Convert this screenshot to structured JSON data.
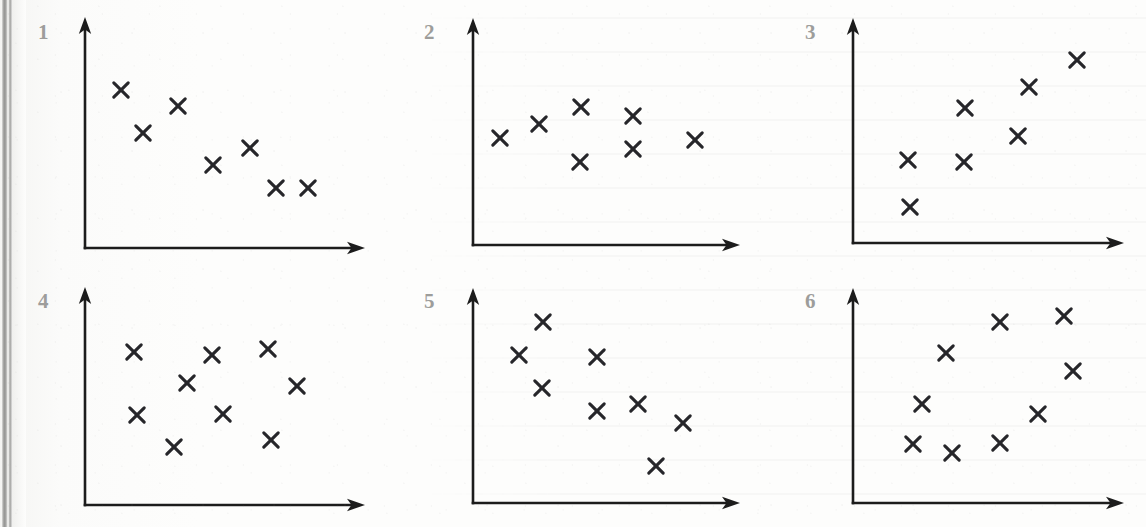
{
  "page": {
    "width": 1146,
    "height": 527,
    "background_color": "#fdfdfc",
    "ink_color": "#1c1c1c",
    "marker_color": "#26262a",
    "label_color": "#9d9d9b",
    "marker_glyph": "x"
  },
  "chart_data": [
    {
      "id": 1,
      "type": "scatter",
      "title": "1",
      "xlabel": "",
      "ylabel": "",
      "grid": false,
      "legend": "none",
      "relationship": "strong negative correlation",
      "axis": {
        "origin_x": 85,
        "origin_y": 248,
        "x_end": 365,
        "y_top": 17
      },
      "xlim": [
        0,
        1
      ],
      "ylim": [
        0,
        1
      ],
      "points": [
        {
          "px": 121,
          "py": 90
        },
        {
          "px": 143,
          "py": 133
        },
        {
          "px": 178,
          "py": 106
        },
        {
          "px": 213,
          "py": 165
        },
        {
          "px": 250,
          "py": 148
        },
        {
          "px": 276,
          "py": 188
        },
        {
          "px": 308,
          "py": 188
        }
      ],
      "n_points": 7
    },
    {
      "id": 2,
      "type": "scatter",
      "title": "2",
      "xlabel": "",
      "ylabel": "",
      "grid": false,
      "legend": "none",
      "relationship": "no correlation / flat",
      "axis": {
        "origin_x": 473,
        "origin_y": 245,
        "x_end": 740,
        "y_top": 18
      },
      "xlim": [
        0,
        1
      ],
      "ylim": [
        0,
        1
      ],
      "points": [
        {
          "px": 500,
          "py": 138
        },
        {
          "px": 539,
          "py": 124
        },
        {
          "px": 581,
          "py": 107
        },
        {
          "px": 580,
          "py": 162
        },
        {
          "px": 633,
          "py": 116
        },
        {
          "px": 633,
          "py": 149
        },
        {
          "px": 695,
          "py": 140
        }
      ],
      "n_points": 7
    },
    {
      "id": 3,
      "type": "scatter",
      "title": "3",
      "xlabel": "",
      "ylabel": "",
      "grid": false,
      "legend": "none",
      "relationship": "strong positive correlation",
      "axis": {
        "origin_x": 853,
        "origin_y": 243,
        "x_end": 1124,
        "y_top": 18
      },
      "xlim": [
        0,
        1
      ],
      "ylim": [
        0,
        1
      ],
      "points": [
        {
          "px": 908,
          "py": 160
        },
        {
          "px": 910,
          "py": 207
        },
        {
          "px": 964,
          "py": 162
        },
        {
          "px": 965,
          "py": 108
        },
        {
          "px": 1018,
          "py": 136
        },
        {
          "px": 1029,
          "py": 87
        },
        {
          "px": 1077,
          "py": 60
        }
      ],
      "n_points": 7
    },
    {
      "id": 4,
      "type": "scatter",
      "title": "4",
      "xlabel": "",
      "ylabel": "",
      "grid": false,
      "legend": "none",
      "relationship": "no correlation / random scatter",
      "axis": {
        "origin_x": 85,
        "origin_y": 505,
        "x_end": 365,
        "y_top": 287
      },
      "xlim": [
        0,
        1
      ],
      "ylim": [
        0,
        1
      ],
      "points": [
        {
          "px": 134,
          "py": 352
        },
        {
          "px": 187,
          "py": 383
        },
        {
          "px": 212,
          "py": 355
        },
        {
          "px": 137,
          "py": 415
        },
        {
          "px": 223,
          "py": 414
        },
        {
          "px": 174,
          "py": 447
        },
        {
          "px": 268,
          "py": 349
        },
        {
          "px": 297,
          "py": 386
        },
        {
          "px": 271,
          "py": 440
        }
      ],
      "n_points": 9
    },
    {
      "id": 5,
      "type": "scatter",
      "title": "5",
      "xlabel": "",
      "ylabel": "",
      "grid": false,
      "legend": "none",
      "relationship": "moderate negative correlation",
      "axis": {
        "origin_x": 473,
        "origin_y": 503,
        "x_end": 740,
        "y_top": 288
      },
      "xlim": [
        0,
        1
      ],
      "ylim": [
        0,
        1
      ],
      "points": [
        {
          "px": 519,
          "py": 355
        },
        {
          "px": 543,
          "py": 322
        },
        {
          "px": 542,
          "py": 388
        },
        {
          "px": 597,
          "py": 357
        },
        {
          "px": 597,
          "py": 411
        },
        {
          "px": 638,
          "py": 404
        },
        {
          "px": 683,
          "py": 423
        },
        {
          "px": 656,
          "py": 466
        }
      ],
      "n_points": 8
    },
    {
      "id": 6,
      "type": "scatter",
      "title": "6",
      "xlabel": "",
      "ylabel": "",
      "grid": false,
      "legend": "none",
      "relationship": "weak positive correlation",
      "axis": {
        "origin_x": 853,
        "origin_y": 503,
        "x_end": 1124,
        "y_top": 288
      },
      "xlim": [
        0,
        1
      ],
      "ylim": [
        0,
        1
      ],
      "points": [
        {
          "px": 913,
          "py": 444
        },
        {
          "px": 922,
          "py": 404
        },
        {
          "px": 946,
          "py": 353
        },
        {
          "px": 952,
          "py": 453
        },
        {
          "px": 1000,
          "py": 322
        },
        {
          "px": 1000,
          "py": 443
        },
        {
          "px": 1038,
          "py": 414
        },
        {
          "px": 1064,
          "py": 316
        },
        {
          "px": 1073,
          "py": 371
        }
      ],
      "n_points": 9
    }
  ],
  "panel_labels": [
    {
      "text": "1",
      "x": 38,
      "y": 22
    },
    {
      "text": "2",
      "x": 424,
      "y": 22
    },
    {
      "text": "3",
      "x": 805,
      "y": 22
    },
    {
      "text": "4",
      "x": 38,
      "y": 291
    },
    {
      "text": "5",
      "x": 424,
      "y": 291
    },
    {
      "text": "6",
      "x": 805,
      "y": 291
    }
  ]
}
